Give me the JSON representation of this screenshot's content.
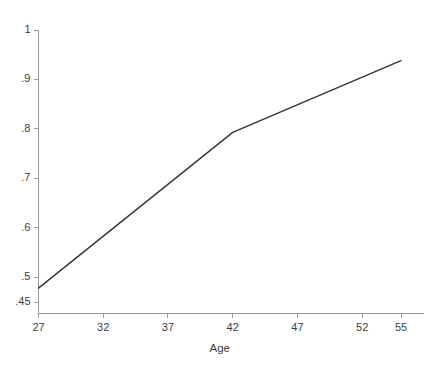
{
  "chart_data": {
    "type": "line",
    "title": "",
    "subtitle": "",
    "xlabel": "Age",
    "ylabel": "",
    "x": [
      27,
      42,
      55
    ],
    "values": [
      0.478,
      0.793,
      0.938
    ],
    "series": [
      {
        "name": "predicted",
        "x": [
          27,
          42,
          55
        ],
        "values": [
          0.478,
          0.793,
          0.938
        ]
      }
    ],
    "xlim": [
      27,
      55
    ],
    "ylim": [
      0.45,
      1.0
    ],
    "xticks": [
      27,
      32,
      37,
      42,
      47,
      52,
      55
    ],
    "xticklabels": [
      "27",
      "32",
      "37",
      "42",
      "47",
      "52",
      "55"
    ],
    "yticks": [
      0.45,
      0.5,
      0.6,
      0.7,
      0.8,
      0.9,
      1.0
    ],
    "yticklabels": [
      ".45",
      ".5",
      ".6",
      ".7",
      ".8",
      ".9",
      "1"
    ],
    "grid": false,
    "legend": null,
    "legend_position": "none",
    "annotations": [],
    "line_color": "#333333",
    "axis_color": "#9a9a9a",
    "background_color": "#ffffff"
  },
  "axes": {
    "x_title": "Age"
  }
}
